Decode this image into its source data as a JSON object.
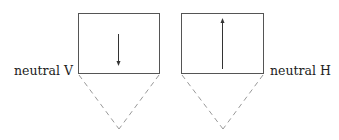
{
  "diagram": {
    "panels": [
      {
        "label": "neutral V",
        "arrow_direction": "down"
      },
      {
        "label": "neutral H",
        "arrow_direction": "up"
      }
    ],
    "colors": {
      "line": "#333333",
      "dashed": "#999999"
    }
  }
}
